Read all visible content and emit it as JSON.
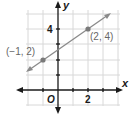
{
  "graph": {
    "x_axis_label": "x",
    "y_axis_label": "y",
    "origin_label": "O",
    "x_tick_label": "2",
    "y_tick_label": "4",
    "points": [
      {
        "label": "(−1, 2)",
        "x": -1,
        "y": 2
      },
      {
        "label": "(2, 4)",
        "x": 2,
        "y": 4
      }
    ],
    "grid": {
      "x_min": -2,
      "x_max": 4,
      "y_min": -1,
      "y_max": 5
    },
    "colors": {
      "grid": "#d8d8d8",
      "axis": "#1a1a1a",
      "line": "#8a8a8a",
      "point": "#7a7a7a",
      "text": "#666666"
    }
  }
}
